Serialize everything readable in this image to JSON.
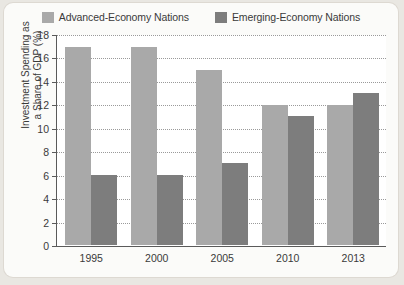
{
  "chart_data": {
    "type": "bar",
    "title": "",
    "xlabel": "",
    "ylabel_lines": [
      "Investment Spending as",
      "a Share of GDP (%)"
    ],
    "ylabel": "Investment Spending as a Share of GDP (%)",
    "categories": [
      "1995",
      "2000",
      "2005",
      "2010",
      "2013"
    ],
    "series": [
      {
        "name": "Advanced-Economy Nations",
        "color": "#a9a9a9",
        "values": [
          17,
          17,
          15,
          12,
          12
        ]
      },
      {
        "name": "Emerging-Economy Nations",
        "color": "#7d7d7d",
        "values": [
          6,
          6,
          7,
          11,
          13
        ]
      }
    ],
    "ylim": [
      0,
      18
    ],
    "yticks": [
      18,
      16,
      14,
      12,
      10,
      8,
      6,
      4,
      2,
      0
    ],
    "grid": true,
    "legend_position": "top-center"
  },
  "colors": {
    "advanced": "#a9a9a9",
    "emerging": "#7d7d7d",
    "axis": "#5a5a5a",
    "grid": "#9a9a9a",
    "panel": "#fbfbf9",
    "page": "#e9e7e2",
    "text": "#3a3a3a"
  }
}
